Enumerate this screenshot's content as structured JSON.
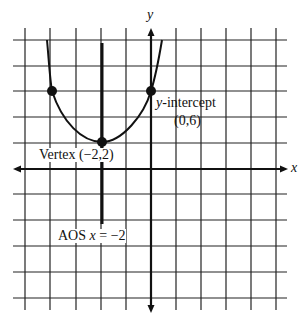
{
  "diagram": {
    "type": "parabola-graph",
    "equation_features": {
      "vertex": "(-2,2)",
      "y_intercept": "(0,6)",
      "axis_of_symmetry": "x = -2"
    },
    "axes": {
      "x_label": "x",
      "y_label": "y"
    },
    "labels": {
      "y_intercept_var": "y",
      "y_intercept_text": "-intercept",
      "y_intercept_point": "(0,6)",
      "vertex_text": "Vertex (−2,2)",
      "aos_prefix": "AOS ",
      "aos_var": "x",
      "aos_suffix": " = −2"
    },
    "points": [
      {
        "name": "left-point",
        "x": -4,
        "y": 6
      },
      {
        "name": "vertex",
        "x": -2,
        "y": 2
      },
      {
        "name": "y-intercept",
        "x": 0,
        "y": 6
      }
    ],
    "colors": {
      "line": "#111111",
      "grid": "#222222",
      "background": "#ffffff"
    }
  }
}
